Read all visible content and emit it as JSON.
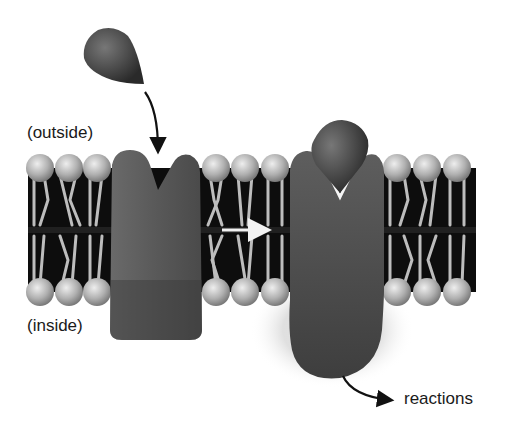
{
  "diagram": {
    "type": "membrane-receptor-signaling",
    "labels": {
      "outside": "(outside)",
      "inside": "(inside)",
      "reactions": "reactions"
    },
    "elements": {
      "ligand_free": "signal molecule (ligand) approaching receptor",
      "receptor_unbound": "receptor protein with empty binding site",
      "receptor_bound": "receptor protein with ligand bound, changed shape",
      "membrane": "phospholipid bilayer",
      "arrow_binding": "arrow from ligand to binding site",
      "arrow_transition": "arrow from unbound to bound state",
      "arrow_reactions": "arrow from bound receptor to reactions"
    },
    "colors": {
      "protein": "#555555",
      "membrane_core": "#0d0d0d",
      "lipid_head": "#b5b5b5",
      "lipid_tail": "#bdbdbd",
      "text": "#1a1a1a"
    }
  }
}
